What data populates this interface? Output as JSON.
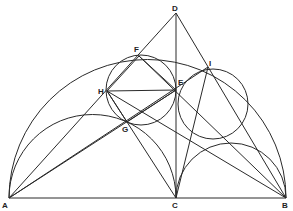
{
  "figure": {
    "type": "arbelos geometric construction",
    "width": 293,
    "height": 211,
    "colors": {
      "stroke": "#2a2a2a",
      "label": "#222222",
      "background": "#ffffff"
    }
  },
  "points": {
    "A": {
      "label": "A",
      "x": 9,
      "y": 198,
      "lx": 2,
      "ly": 208
    },
    "B": {
      "label": "B",
      "x": 286,
      "y": 198,
      "lx": 282,
      "ly": 208
    },
    "C": {
      "label": "C",
      "x": 176,
      "y": 198,
      "lx": 172,
      "ly": 208
    },
    "D": {
      "label": "D",
      "x": 176,
      "y": 13,
      "lx": 172,
      "ly": 11
    },
    "E": {
      "label": "E",
      "x": 176,
      "y": 90,
      "lx": 178,
      "ly": 85
    },
    "F": {
      "label": "F",
      "x": 139,
      "y": 56,
      "lx": 134,
      "ly": 52
    },
    "G": {
      "label": "G",
      "x": 127,
      "y": 122,
      "lx": 122,
      "ly": 132
    },
    "H": {
      "label": "H",
      "x": 107,
      "y": 91,
      "lx": 98,
      "ly": 94
    },
    "I": {
      "label": "I",
      "x": 208,
      "y": 67,
      "lx": 209,
      "ly": 66
    }
  },
  "arcs": [
    {
      "name": "semicircle-AB",
      "cx": 147.5,
      "cy": 198,
      "r": 138.5
    },
    {
      "name": "semicircle-AC",
      "cx": 92.5,
      "cy": 198,
      "r": 83.5
    },
    {
      "name": "semicircle-CB",
      "cx": 231,
      "cy": 198,
      "r": 55
    }
  ],
  "circles": [
    {
      "name": "inscribed-circle-left",
      "cx": 141,
      "cy": 90,
      "r": 35
    },
    {
      "name": "inscribed-circle-right",
      "cx": 213,
      "cy": 104,
      "r": 35
    }
  ],
  "segments": [
    [
      "A",
      "B"
    ],
    [
      "C",
      "D"
    ],
    [
      "A",
      "D"
    ],
    [
      "B",
      "D"
    ],
    [
      "H",
      "E"
    ],
    [
      "H",
      "F"
    ],
    [
      "F",
      "E"
    ],
    [
      "H",
      "G"
    ],
    [
      "G",
      "E"
    ],
    [
      "A",
      "E"
    ],
    [
      "B",
      "H"
    ],
    [
      "A",
      "I"
    ],
    [
      "B",
      "F"
    ],
    [
      "C",
      "I"
    ],
    [
      "H",
      "C"
    ]
  ]
}
